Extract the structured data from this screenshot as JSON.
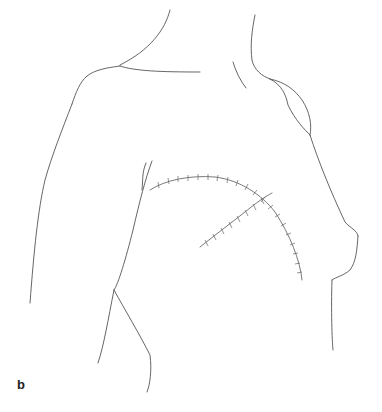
{
  "figure": {
    "panel_label": "b",
    "annotations": [
      "curved-incision-suture",
      "secondary-incision-suture"
    ],
    "colors": {
      "line": "#555555",
      "suture": "#6a6a6a",
      "background": "#ffffff"
    }
  }
}
